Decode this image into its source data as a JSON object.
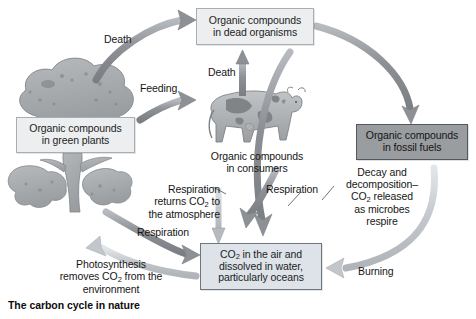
{
  "figure": {
    "caption": "The carbon cycle in nature",
    "background_color": "#ffffff"
  },
  "colors": {
    "box_light_fill": "#eceef0",
    "box_blue_fill": "#dde3e9",
    "box_dark_fill": "#9a9da0",
    "box_border": "#6f767d",
    "arrow_dark": "#8d9195",
    "arrow_light": "#c3c7cb",
    "illustration": "#a3a7aa",
    "text": "#161616"
  },
  "boxes": {
    "dead_organisms": {
      "line1": "Organic compounds",
      "line2": "in dead organisms",
      "style": "light"
    },
    "green_plants": {
      "line1": "Organic compounds",
      "line2": "in green plants",
      "style": "light"
    },
    "fossil_fuels": {
      "line1": "Organic compounds",
      "line2": "in fossil fuels",
      "style": "dark"
    },
    "co2_air_water": {
      "line1": "CO",
      "line1_sub": "2",
      "line1_rest": " in the air and",
      "line2": "dissolved in water,",
      "line3": "particularly oceans",
      "style": "blue"
    }
  },
  "consumers_label": {
    "line1": "Organic compounds",
    "line2": "in consumers"
  },
  "arrow_labels": {
    "death_plants": "Death",
    "feeding": "Feeding",
    "death_consumers": "Death",
    "respiration_returns": {
      "line1": "Respiration",
      "line2a": "returns CO",
      "line2sub": "2",
      "line2b": " to",
      "line3": "the atmosphere"
    },
    "respiration_tree": "Respiration",
    "respiration_consumers": "Respiration",
    "decay": {
      "line1": "Decay and",
      "line2": "decomposition–",
      "line3a": "CO",
      "line3sub": "2",
      "line3b": " released",
      "line4": "as microbes",
      "line5": "respire"
    },
    "burning": "Burning",
    "photosynthesis": {
      "line1": "Photosynthesis",
      "line2a": "removes CO",
      "line2sub": "2",
      "line2b": " from the",
      "line3": "environment"
    }
  },
  "illustrations": {
    "tree": "tree-illustration",
    "cow": "cow-illustration"
  }
}
